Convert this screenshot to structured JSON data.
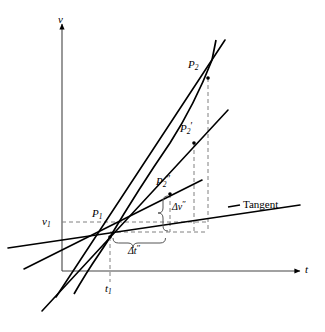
{
  "figure": {
    "background_color": "#ffffff",
    "stroke_color": "#000000",
    "dash_color": "#808080",
    "width": 325,
    "height": 332
  },
  "axes": {
    "y_label": "v",
    "x_label": "t",
    "origin": {
      "x": 62,
      "y": 271
    },
    "y_axis_top": {
      "x": 62,
      "y": 24
    },
    "x_axis_right": {
      "x": 300,
      "y": 271
    }
  },
  "ticks": {
    "v1_label": "v",
    "v1_sub": "1",
    "v1_value_y": 222,
    "t1_label": "t",
    "t1_sub": "1",
    "t1_value_x": 110
  },
  "points": [
    {
      "name": "P1",
      "base": "P",
      "sub": "1",
      "prime": "",
      "label_x": 92,
      "label_y": 206,
      "px": 110,
      "py": 237
    },
    {
      "name": "P2",
      "base": "P",
      "sub": "2",
      "prime": "",
      "label_x": 188,
      "label_y": 57,
      "px": 208,
      "py": 78
    },
    {
      "name": "P2-prime",
      "base": "P",
      "sub": "2",
      "prime": "′",
      "label_x": 180,
      "label_y": 121,
      "px": 194,
      "py": 143
    },
    {
      "name": "P2-double-prime",
      "base": "P",
      "sub": "2",
      "prime": "″",
      "label_x": 156,
      "label_y": 174,
      "px": 170,
      "py": 194
    }
  ],
  "annotations": {
    "delta_v": {
      "base": "Δv",
      "prime": "″",
      "x": 172,
      "y": 200
    },
    "delta_t": {
      "base": "Δt",
      "prime": "″",
      "x": 128,
      "y": 244
    },
    "tangent": {
      "label": "Tangent",
      "x": 236,
      "y": 203
    }
  },
  "curve": {
    "description": "Concave-up velocity curve passing through P1, P2'', P2', P2",
    "path": "M 74 294 C 92 262, 104 248, 110 237 C 126 210, 146 178, 170 143 C 186 118, 198 96, 212 60 L 216 40"
  },
  "lines": [
    {
      "name": "tangent-line",
      "x1": 8,
      "y1": 248,
      "x2": 300,
      "y2": 205,
      "width": 1.6
    },
    {
      "name": "secant-to-P2",
      "x1": 56,
      "y1": 297,
      "x2": 225,
      "y2": 40,
      "width": 1.6
    },
    {
      "name": "secant-to-P2-prime",
      "x1": 42,
      "y1": 311,
      "x2": 228,
      "y2": 110,
      "width": 1.6
    },
    {
      "name": "secant-to-P2-double-prime",
      "x1": 24,
      "y1": 269,
      "x2": 202,
      "y2": 180,
      "width": 1.6
    }
  ],
  "dashed": [
    {
      "name": "v1-horizontal",
      "x1": 62,
      "y1": 222,
      "x2": 208,
      "y2": 222
    },
    {
      "name": "t1-vertical",
      "x1": 110,
      "y1": 237,
      "x2": 110,
      "y2": 282
    },
    {
      "name": "P2-vertical",
      "x1": 208,
      "y1": 78,
      "x2": 208,
      "y2": 232
    },
    {
      "name": "P2p-vertical",
      "x1": 194,
      "y1": 143,
      "x2": 194,
      "y2": 232
    },
    {
      "name": "P2pp-vertical",
      "x1": 170,
      "y1": 194,
      "x2": 170,
      "y2": 232
    },
    {
      "name": "bottom-horizontal",
      "x1": 110,
      "y1": 232,
      "x2": 208,
      "y2": 232
    }
  ]
}
